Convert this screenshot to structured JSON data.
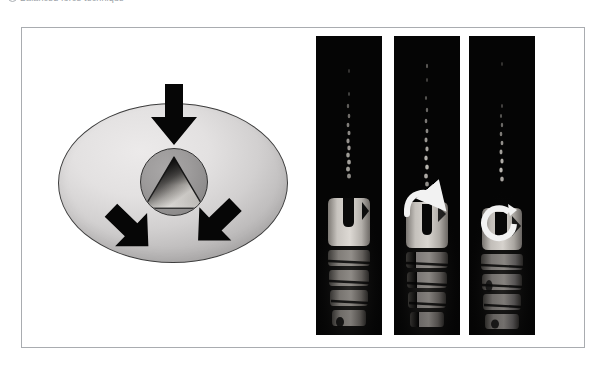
{
  "caption": {
    "bullet_icon": "circle-bullet-icon",
    "text": "Balanced force technique"
  },
  "figure": {
    "frame_name": "figure-frame",
    "border_color": "#a9acb0",
    "background_color": "#ffffff"
  },
  "schematic": {
    "title": "balanced-force-schematic",
    "bone_ellipse": {
      "name": "bone-cross-section",
      "fill_light": "#ecebeb",
      "fill_dark": "#b2b0b0",
      "outline_color": "#3d3d3d"
    },
    "canal_circle": {
      "name": "root-canal-circle",
      "fill_light": "#a9a7a7",
      "fill_dark": "#7e7c7c",
      "outline_color": "#333333"
    },
    "canal_triangle": {
      "name": "canal-triangle-cross-section",
      "fill_light": "#e6e4e2",
      "fill_dark": "#121212",
      "outline_color": "#1a1a1a"
    },
    "force_arrows": [
      {
        "name": "force-arrow-top",
        "direction": "down",
        "color": "#060606"
      },
      {
        "name": "force-arrow-bottom-left",
        "direction": "up-right",
        "color": "#060606"
      },
      {
        "name": "force-arrow-bottom-right",
        "direction": "up-left",
        "color": "#060606"
      }
    ]
  },
  "radiographs": {
    "background_color": "#050505",
    "implant_light": "#d8d4cf",
    "implant_mid": "#8e8a85",
    "implant_dark": "#3a3835",
    "rotation_arrow_color": "#f2f2f2",
    "panels": [
      {
        "name": "radiograph-panel-1",
        "label": "no rotation",
        "rotation_arrow": "none",
        "sweep_degrees": 0
      },
      {
        "name": "radiograph-panel-2",
        "label": "partial clockwise rotation",
        "rotation_arrow": "quarter-turn-arrow-icon",
        "sweep_degrees": 110
      },
      {
        "name": "radiograph-panel-3",
        "label": "full clockwise rotation",
        "rotation_arrow": "full-turn-arrow-icon",
        "sweep_degrees": 300
      }
    ]
  }
}
